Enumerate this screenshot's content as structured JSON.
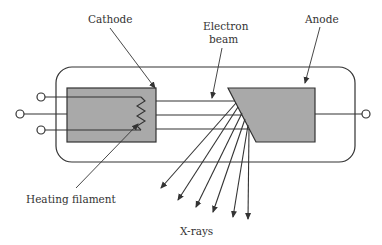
{
  "diagram": {
    "labels": {
      "cathode": "Cathode",
      "electron_beam_line1": "Electron",
      "electron_beam_line2": "beam",
      "anode": "Anode",
      "heating_filament": "Heating filament",
      "xrays": "X-rays"
    },
    "colors": {
      "fill_gray": "#a9a9a9",
      "stroke": "#333333",
      "background": "#ffffff"
    },
    "components": [
      "glass envelope",
      "cathode",
      "heating filament",
      "electron beam",
      "anode",
      "x-ray emission"
    ],
    "xray_arrow_count": 6,
    "beam_line_count": 3
  }
}
